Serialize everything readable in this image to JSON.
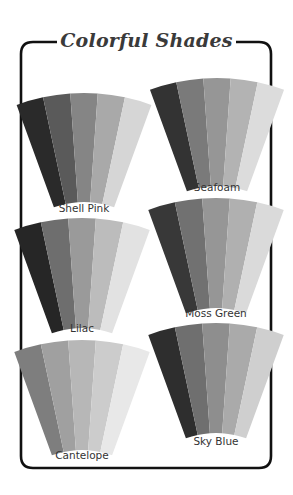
{
  "title": "Colorful Shades",
  "frame": {
    "color": "#111111"
  },
  "swatches": [
    {
      "name": "Shell Pink",
      "shades": [
        "#2a2a2a",
        "#5a5a5a",
        "#858585",
        "#a9a9a9",
        "#d6d6d6"
      ]
    },
    {
      "name": "Seafoam",
      "shades": [
        "#333333",
        "#7a7a7a",
        "#969696",
        "#b3b3b3",
        "#dcdcdc"
      ]
    },
    {
      "name": "Lilac",
      "shades": [
        "#262626",
        "#6e6e6e",
        "#9a9a9a",
        "#bcbcbc",
        "#e2e2e2"
      ]
    },
    {
      "name": "Moss Green",
      "shades": [
        "#383838",
        "#717171",
        "#969696",
        "#b0b0b0",
        "#dadada"
      ]
    },
    {
      "name": "Cantelope",
      "shades": [
        "#7e7e7e",
        "#a0a0a0",
        "#b7b7b7",
        "#cccccc",
        "#e8e8e8"
      ]
    },
    {
      "name": "Sky Blue",
      "shades": [
        "#2e2e2e",
        "#6f6f6f",
        "#8e8e8e",
        "#aaaaaa",
        "#cfcfcf"
      ]
    }
  ]
}
